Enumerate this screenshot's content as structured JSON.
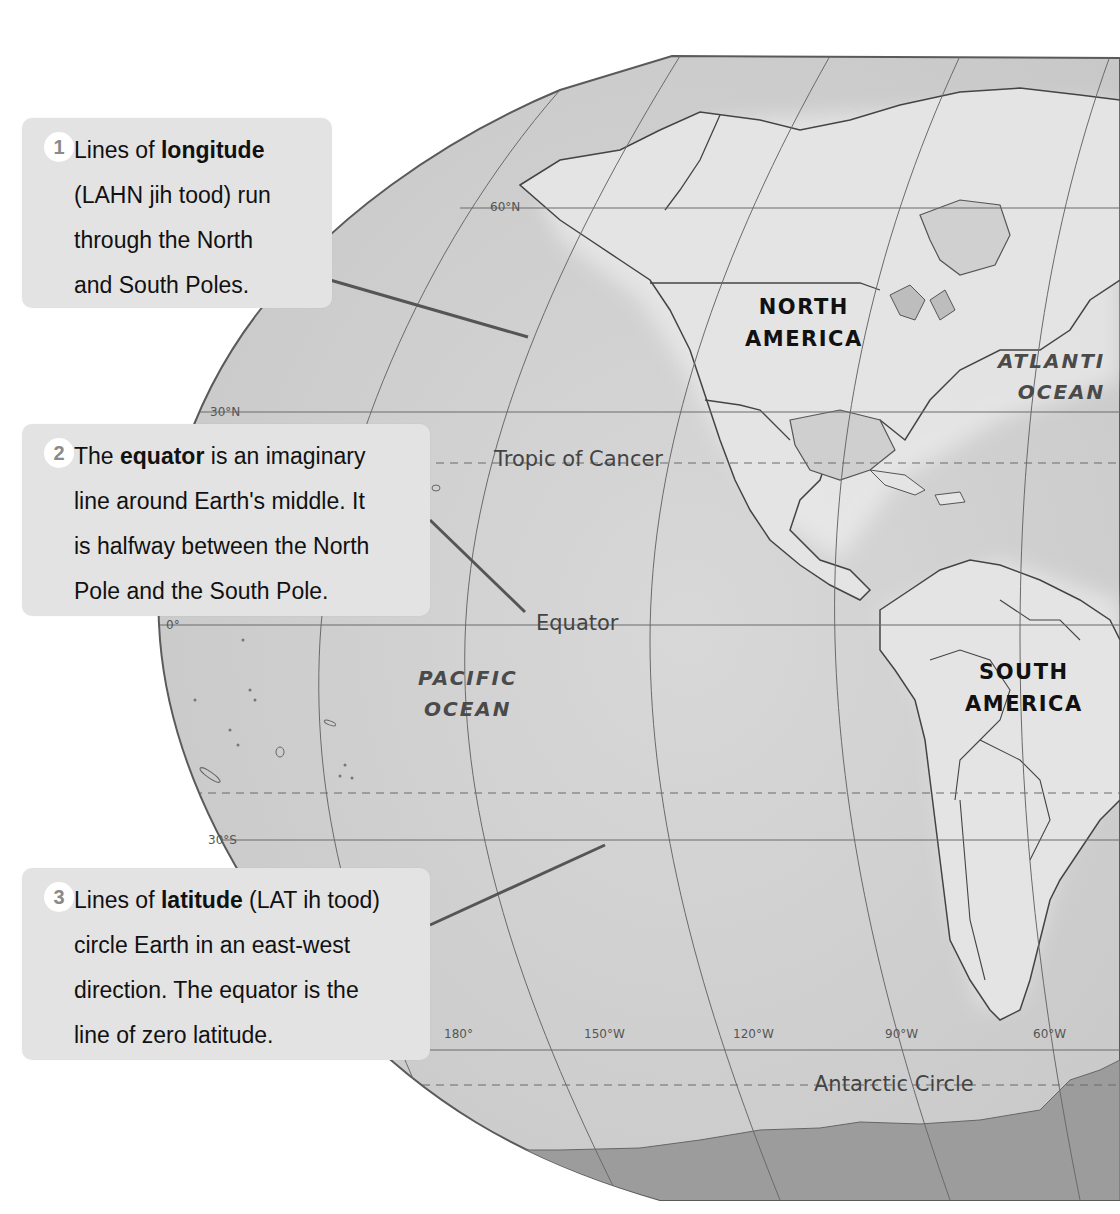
{
  "callouts": [
    {
      "number": "1",
      "line1_pre": "Lines of ",
      "line1_bold": "longitude",
      "line1_post": "",
      "rest": [
        "(LAHN jih tood) run",
        "through the North",
        "and South Poles."
      ]
    },
    {
      "number": "2",
      "line1_pre": "The ",
      "line1_bold": "equator",
      "line1_post": " is an imaginary",
      "rest": [
        "line around Earth's middle. It",
        "is halfway between the North",
        "Pole and the South Pole."
      ]
    },
    {
      "number": "3",
      "line1_pre": "Lines of ",
      "line1_bold": "latitude",
      "line1_post": " (LAT ih tood)",
      "rest": [
        "circle Earth in an east-west",
        "direction. The equator is the",
        "line of zero latitude."
      ]
    }
  ],
  "continents": {
    "north_america": [
      "NORTH",
      "AMERICA"
    ],
    "south_america": [
      "SOUTH",
      "AMERICA"
    ]
  },
  "oceans": {
    "pacific": [
      "PACIFIC",
      "OCEAN"
    ],
    "atlantic": [
      "ATLANTI",
      "OCEAN"
    ]
  },
  "lines": {
    "tropic_of_cancer": "Tropic of Cancer",
    "equator": "Equator",
    "antarctic_circle": "Antarctic Circle"
  },
  "latitude_ticks": [
    "60°N",
    "30°N",
    "0°",
    "30°S"
  ],
  "longitude_ticks": [
    "180°",
    "150°W",
    "120°W",
    "90°W",
    "60°W"
  ],
  "colors": {
    "ocean": "#d2d2d2",
    "land": "#e6e6e6",
    "antarctica": "#9c9c9c",
    "callout_bg": "#e3e3e3",
    "grid": "#6a6a6a"
  }
}
